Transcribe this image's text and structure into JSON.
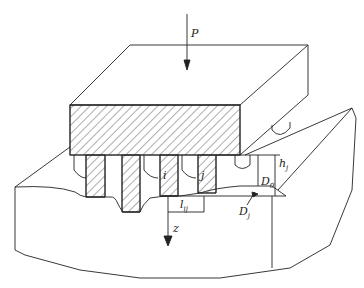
{
  "diagram": {
    "title": "",
    "type": "rough-surface contact schematic (indenter with asperities pressed into half-space)",
    "colors": {
      "stroke": "#222222",
      "background": "#ffffff"
    },
    "labels": {
      "load": "P",
      "asperity_i": "i",
      "asperity_j": "j",
      "distance_base": "l",
      "distance_sub": "ij",
      "separation_base": "D",
      "separation_sub": "0",
      "height_base": "h",
      "height_sub": "j",
      "depth_base": "D",
      "depth_sub": "j",
      "axis": "z"
    }
  }
}
